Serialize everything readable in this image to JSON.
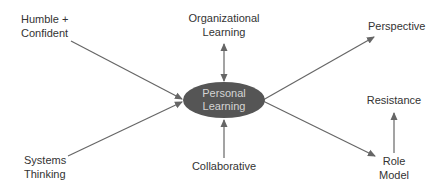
{
  "diagram": {
    "type": "hub-and-spoke concept map",
    "center": {
      "line1": "Personal",
      "line2": "Learning",
      "fill_color": "#555555",
      "text_color": "#d4d4d4"
    },
    "nodes": {
      "humble_confident": {
        "line1": "Humble +",
        "line2": "Confident"
      },
      "systems_thinking": {
        "line1": "Systems",
        "line2": "Thinking"
      },
      "organizational_learning": {
        "line1": "Organizational",
        "line2": "Learning"
      },
      "collaborative": {
        "line1": "Collaborative"
      },
      "perspective": {
        "line1": "Perspective"
      },
      "resistance": {
        "line1": "Resistance"
      },
      "role_model": {
        "line1": "Role",
        "line2": "Model"
      }
    },
    "edges": [
      {
        "from": "Humble + Confident",
        "to": "Personal Learning",
        "direction": "one-way"
      },
      {
        "from": "Systems Thinking",
        "to": "Personal Learning",
        "direction": "one-way"
      },
      {
        "from": "Organizational Learning",
        "to": "Personal Learning",
        "direction": "two-way"
      },
      {
        "from": "Collaborative",
        "to": "Personal Learning",
        "direction": "one-way"
      },
      {
        "from": "Personal Learning",
        "to": "Perspective",
        "direction": "one-way"
      },
      {
        "from": "Personal Learning",
        "to": "Role Model",
        "direction": "one-way"
      },
      {
        "from": "Role Model",
        "to": "Resistance",
        "direction": "one-way"
      }
    ],
    "colors": {
      "line": "#666666",
      "label_text": "#333333",
      "background": "#ffffff"
    }
  }
}
